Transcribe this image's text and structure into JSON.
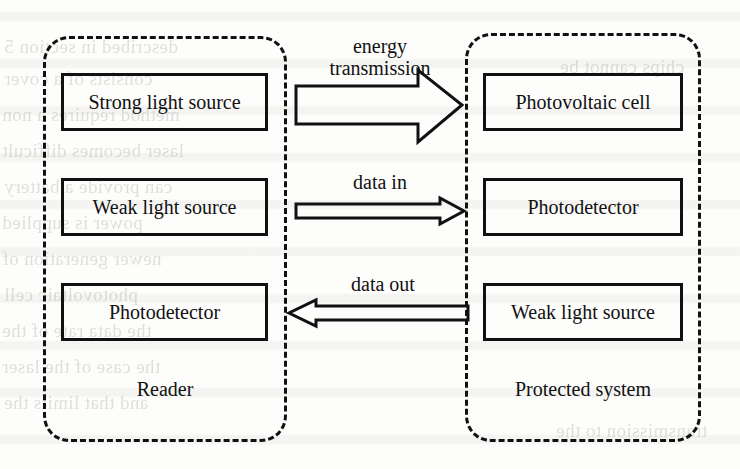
{
  "figure": {
    "type": "block-diagram",
    "background_color": "#fdfdfc",
    "ink_color": "#111111"
  },
  "zones": [
    {
      "id": "reader",
      "label": "Reader",
      "border_style": "dashed",
      "components": [
        {
          "id": "reader-strong-source",
          "label": "Strong light source"
        },
        {
          "id": "reader-weak-source",
          "label": "Weak light source"
        },
        {
          "id": "reader-photodetector",
          "label": "Photodetector"
        }
      ]
    },
    {
      "id": "protected-system",
      "label": "Protected system",
      "border_style": "dashed",
      "components": [
        {
          "id": "protected-photovoltaic-cell",
          "label": "Photovoltaic cell"
        },
        {
          "id": "protected-photodetector",
          "label": "Photodetector"
        },
        {
          "id": "protected-weak-source",
          "label": "Weak light source"
        }
      ]
    }
  ],
  "arrows": [
    {
      "id": "energy-transmission",
      "caption_line1": "energy",
      "caption_line2": "transmission",
      "direction": "right",
      "weight": "thick",
      "from": "reader-strong-source",
      "to": "protected-photovoltaic-cell"
    },
    {
      "id": "data-in",
      "caption_line1": "data in",
      "caption_line2": "",
      "direction": "right",
      "weight": "thin",
      "from": "reader-weak-source",
      "to": "protected-photodetector"
    },
    {
      "id": "data-out",
      "caption_line1": "data out",
      "caption_line2": "",
      "direction": "left",
      "weight": "thin",
      "from": "protected-weak-source",
      "to": "reader-photodetector"
    }
  ],
  "ghost_text": [
    {
      "text": "described in section 5"
    },
    {
      "text": "consists of a cover"
    },
    {
      "text": "method requires a non"
    },
    {
      "text": "laser becomes difficult"
    },
    {
      "text": "can provide a battery"
    },
    {
      "text": "power is supplied"
    },
    {
      "text": "newer generation of"
    },
    {
      "text": "photovoltaic cell"
    },
    {
      "text": "the data rate of the"
    },
    {
      "text": "the case of the laser"
    },
    {
      "text": "and that limits the"
    },
    {
      "text": "chips cannot be"
    },
    {
      "text": "transmission to the"
    }
  ]
}
